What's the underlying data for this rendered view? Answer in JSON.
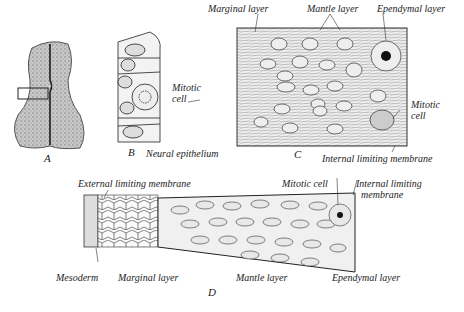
{
  "figure": {
    "panels": {
      "A": {
        "letter": "A"
      },
      "B": {
        "letter": "B",
        "labels": {
          "mitotic_cell_1": "Mitotic",
          "mitotic_cell_2": "cell",
          "neural_epithelium": "Neural epithelium"
        }
      },
      "C": {
        "letter": "C",
        "labels": {
          "marginal_layer": "Marginal layer",
          "mantle_layer": "Mantle layer",
          "ependymal_layer": "Ependymal layer",
          "mitotic_cell_1": "Mitotic",
          "mitotic_cell_2": "cell",
          "internal_limiting_membrane": "Internal limiting membrane"
        }
      },
      "D": {
        "letter": "D",
        "labels": {
          "external_limiting_membrane": "External limiting membrane",
          "mitotic_cell": "Mitotic cell",
          "internal_limiting_membrane_1": "Internal limiting",
          "internal_limiting_membrane_2": "membrane",
          "mesoderm": "Mesoderm",
          "marginal_layer": "Marginal layer",
          "mantle_layer": "Mantle layer",
          "ependymal_layer": "Ependymal layer"
        }
      }
    },
    "colors": {
      "ink": "#222222",
      "tissue": "#bdbdbd",
      "background": "#ffffff"
    }
  }
}
